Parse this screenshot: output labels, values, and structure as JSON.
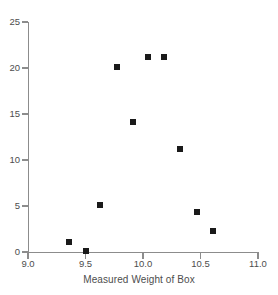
{
  "chart_data": {
    "type": "scatter",
    "title": "",
    "xlabel": "Measured Weight of Box",
    "ylabel": "",
    "xlim": [
      9.0,
      11.0
    ],
    "ylim": [
      0,
      25
    ],
    "grid": false,
    "legend": null,
    "x_ticks": [
      "9.0",
      "9.5",
      "10.0",
      "10.5",
      "11.0"
    ],
    "x_tick_values": [
      9.0,
      9.5,
      10.0,
      10.5,
      11.0
    ],
    "y_ticks": [
      "0",
      "5",
      "10",
      "15",
      "20",
      "25"
    ],
    "y_tick_values": [
      0,
      5,
      10,
      15,
      20,
      25
    ],
    "marker": "square",
    "marker_color": "#1a1a1a",
    "axis_color": "#8c8c8c",
    "label_color": "#4d4d4d",
    "points": [
      {
        "x": 9.36,
        "y": 1.1
      },
      {
        "x": 9.5,
        "y": 0.1
      },
      {
        "x": 9.63,
        "y": 5.1
      },
      {
        "x": 9.77,
        "y": 20.1
      },
      {
        "x": 9.91,
        "y": 14.1
      },
      {
        "x": 10.04,
        "y": 21.2
      },
      {
        "x": 10.18,
        "y": 21.2
      },
      {
        "x": 10.32,
        "y": 11.2
      },
      {
        "x": 10.47,
        "y": 4.3
      },
      {
        "x": 10.61,
        "y": 2.3
      }
    ]
  }
}
